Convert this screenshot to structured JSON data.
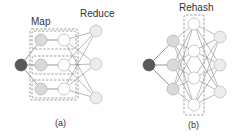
{
  "panel_a": {
    "map_label": "Map",
    "reduce_label": "Reduce",
    "caption": "(a)",
    "source": {
      "x": 21,
      "y": 65,
      "r": 6
    },
    "map_rows": [
      {
        "gray": {
          "x": 41,
          "y": 40
        },
        "white": {
          "x": 64,
          "y": 40
        },
        "box": {
          "x": 32,
          "y": 31,
          "w": 44,
          "h": 18
        }
      },
      {
        "gray": {
          "x": 41,
          "y": 65
        },
        "white": {
          "x": 64,
          "y": 65
        },
        "box": {
          "x": 32,
          "y": 56,
          "w": 44,
          "h": 18
        }
      },
      {
        "gray": {
          "x": 41,
          "y": 89
        },
        "white": {
          "x": 64,
          "y": 89
        },
        "box": {
          "x": 32,
          "y": 80,
          "w": 44,
          "h": 18
        }
      }
    ],
    "outer_box": {
      "x": 30,
      "y": 29,
      "w": 48,
      "h": 71
    },
    "reduce_nodes": [
      {
        "x": 96,
        "y": 31
      },
      {
        "x": 96,
        "y": 64
      },
      {
        "x": 96,
        "y": 98
      }
    ],
    "node_r": 6
  },
  "panel_b": {
    "rehash_label": "Rehash",
    "caption": "(b)",
    "source": {
      "x": 149,
      "y": 65,
      "r": 6
    },
    "gray_nodes": [
      {
        "x": 173,
        "y": 41
      },
      {
        "x": 173,
        "y": 65
      },
      {
        "x": 173,
        "y": 89
      }
    ],
    "rehash_nodes": [
      {
        "x": 194,
        "y": 24
      },
      {
        "x": 194,
        "y": 51
      },
      {
        "x": 194,
        "y": 78
      },
      {
        "x": 194,
        "y": 105
      }
    ],
    "rehash_box": {
      "x": 184,
      "y": 15,
      "w": 20,
      "h": 100
    },
    "right_nodes": [
      {
        "x": 220,
        "y": 37
      },
      {
        "x": 220,
        "y": 65
      },
      {
        "x": 220,
        "y": 92
      }
    ],
    "node_r": 6
  },
  "colors": {
    "source": "#595959",
    "map_node": "#d9d9d9",
    "white_node": "#ffffff",
    "edge": "#8a8a8a",
    "text": "#333333"
  }
}
